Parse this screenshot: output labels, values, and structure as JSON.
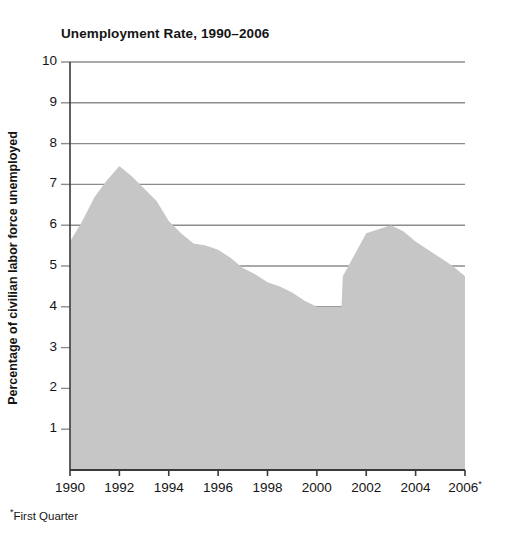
{
  "chart_data": {
    "type": "area",
    "title": "Unemployment Rate, 1990–2006",
    "xlabel": "",
    "ylabel": "Percentage of civilian labor force unemployed",
    "footnote": "First Quarter",
    "footnote_marker": "*",
    "grid": true,
    "legend": "none",
    "xlim": [
      1990,
      2006
    ],
    "ylim": [
      0,
      10
    ],
    "ytick_labels": [
      "10",
      "9",
      "8",
      "7",
      "6",
      "5",
      "4",
      "3",
      "2",
      "1"
    ],
    "ytick_values": [
      10,
      9,
      8,
      7,
      6,
      5,
      4,
      3,
      2,
      1
    ],
    "xtick_labels": [
      "1990",
      "1992",
      "1994",
      "1996",
      "1998",
      "2000",
      "2002",
      "2004",
      "2006"
    ],
    "xtick_values": [
      1990,
      1992,
      1994,
      1996,
      1998,
      2000,
      2002,
      2004,
      2006
    ],
    "xtick_superscripts": [
      "",
      "",
      "",
      "",
      "",
      "",
      "",
      "",
      "*"
    ],
    "series": [
      {
        "name": "Unemployment rate",
        "fill_color": "#c6c6c6",
        "x": [
          1990,
          1990.5,
          1991,
          1991.5,
          1992,
          1992.5,
          1993,
          1993.5,
          1994,
          1994.5,
          1995,
          1995.5,
          1996,
          1996.5,
          1997,
          1997.5,
          1998,
          1998.5,
          1999,
          1999.5,
          2000,
          2000.5,
          2001,
          2001.05,
          2002,
          2002.5,
          2003,
          2003.5,
          2004,
          2004.5,
          2005,
          2005.5,
          2006
        ],
        "values": [
          5.6,
          6.1,
          6.7,
          7.1,
          7.45,
          7.2,
          6.9,
          6.6,
          6.1,
          5.8,
          5.55,
          5.5,
          5.4,
          5.2,
          4.95,
          4.8,
          4.6,
          4.5,
          4.35,
          4.15,
          4.0,
          4.0,
          4.0,
          4.75,
          5.8,
          5.9,
          6.0,
          5.85,
          5.6,
          5.4,
          5.2,
          5.0,
          4.75
        ]
      }
    ],
    "colors": {
      "fill": "#c6c6c6",
      "gridline": "#8c8c8c",
      "axis": "#3a3a3a",
      "text": "#141414",
      "background": "#ffffff"
    }
  }
}
